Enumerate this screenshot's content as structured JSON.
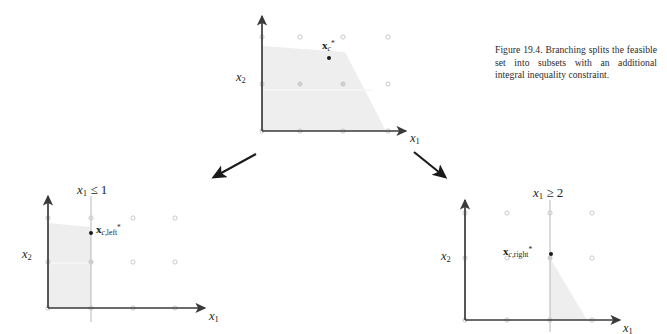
{
  "figure": {
    "caption": {
      "number": "Figure 19.4.",
      "text": "Branching splits the feasible set into subsets with an additional integral inequality constraint."
    },
    "colors": {
      "axis": "#3b3a3a",
      "feasible_fill": "#eeeeee",
      "grid_point": "#c9c9c9",
      "constraint_line": "#bdbdbd",
      "solution_point": "#1a1a1a",
      "arrow": "#1a1a1a",
      "text": "#231f20"
    },
    "plots": [
      {
        "id": "parent",
        "name": "parent-problem-plot",
        "xlabel": "x1",
        "ylabel": "x2",
        "constraint_label": "",
        "solution_label": "xc*",
        "solution_label_parts": {
          "bold": "x",
          "sub": "c",
          "sup": "*"
        },
        "grid_columns": 4,
        "grid_rows": 3,
        "feasible_type": "polygon",
        "solution_point": {
          "x": 2.0,
          "y": 1.6
        }
      },
      {
        "id": "left",
        "name": "left-branch-plot",
        "xlabel": "x1",
        "ylabel": "x2",
        "constraint_label": "x1 ≤ 1",
        "constraint_parts": {
          "var": "x",
          "sub": "1",
          "rel": "≤",
          "value": "1"
        },
        "solution_label": "xc,left*",
        "solution_label_parts": {
          "bold": "x",
          "sub": "c,",
          "subword": "left",
          "sup": "*"
        },
        "grid_columns": 4,
        "grid_rows": 3,
        "feasible_type": "left-strip",
        "solution_point": {
          "x": 1.0,
          "y": 1.7
        }
      },
      {
        "id": "right",
        "name": "right-branch-plot",
        "xlabel": "x1",
        "ylabel": "x2",
        "constraint_label": "x1 ≥ 2",
        "constraint_parts": {
          "var": "x",
          "sub": "1",
          "rel": "≥",
          "value": "2"
        },
        "solution_label": "xc,right*",
        "solution_label_parts": {
          "bold": "x",
          "sub": "c,",
          "subword": "right",
          "sup": "*"
        },
        "grid_columns": 4,
        "grid_rows": 3,
        "feasible_type": "right-triangle",
        "solution_point": {
          "x": 2.0,
          "y": 1.0
        }
      }
    ],
    "arrows": [
      {
        "name": "branch-arrow-left",
        "from": [
          256,
          154
        ],
        "to": [
          212,
          179
        ]
      },
      {
        "name": "branch-arrow-right",
        "from": [
          414,
          152
        ],
        "to": [
          447,
          179
        ]
      }
    ]
  }
}
